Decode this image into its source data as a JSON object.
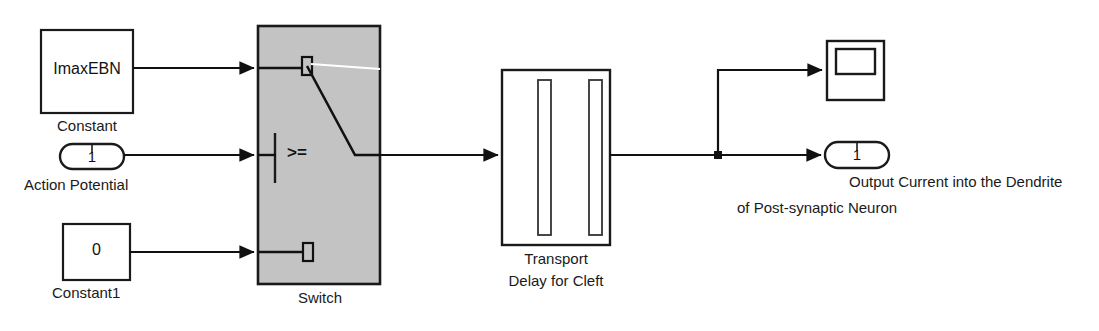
{
  "diagram": {
    "background_color": "#ffffff",
    "line_color": "#1a1a1a",
    "switch_fill_color": "#c3c3c3",
    "block_fill_color": "#ffffff"
  },
  "blocks": {
    "constant": {
      "value_text": "ImaxEBN",
      "caption": "Constant",
      "type": "constant-block"
    },
    "action_potential": {
      "port_number": "1",
      "caption": "Action Potential",
      "type": "inport-block"
    },
    "constant1": {
      "value_text": "0",
      "caption": "Constant1",
      "type": "constant-block"
    },
    "switch": {
      "caption": "Switch",
      "criteria_text": ">=",
      "type": "switch-block"
    },
    "transport_delay": {
      "caption_line1": "Transport",
      "caption_line2": "Delay for Cleft",
      "type": "transport-delay-block"
    },
    "scope": {
      "caption": "",
      "type": "scope-block"
    },
    "output_port": {
      "port_number": "1",
      "caption_line1": "Output Current into the Dendrite",
      "caption_line2": "of Post-synaptic Neuron",
      "type": "outport-block"
    }
  },
  "signals": [
    {
      "name": "constant-to-switch-input1"
    },
    {
      "name": "action-potential-to-switch-control"
    },
    {
      "name": "constant1-to-switch-input3"
    },
    {
      "name": "switch-to-transport-delay"
    },
    {
      "name": "transport-delay-to-branch"
    },
    {
      "name": "branch-to-scope"
    },
    {
      "name": "branch-to-output-port"
    }
  ]
}
